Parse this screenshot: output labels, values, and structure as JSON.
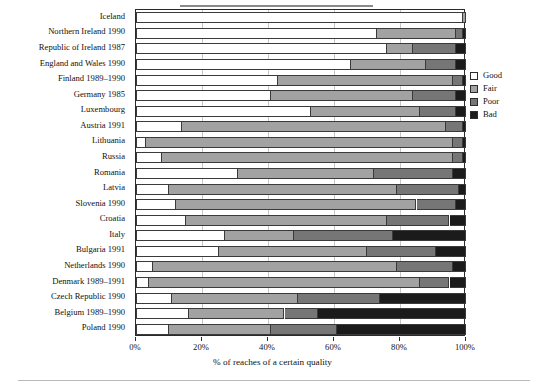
{
  "figure": {
    "axis_title": "% of reaches of a certain quality",
    "x_ticks": [
      "0%",
      "20%",
      "40%",
      "60%",
      "80%",
      "100%"
    ]
  },
  "legend": {
    "items": [
      {
        "label": "Good",
        "color": "#ffffff"
      },
      {
        "label": "Fair",
        "color": "#a2a2a2"
      },
      {
        "label": "Poor",
        "color": "#767676"
      },
      {
        "label": "Bad",
        "color": "#1b1b1b"
      }
    ]
  },
  "chart_data": {
    "type": "bar",
    "orientation": "horizontal",
    "stacked": true,
    "stack_mode": "percent",
    "title": "",
    "xlabel": "% of reaches of a certain quality",
    "ylabel": "",
    "xlim": [
      0,
      100
    ],
    "xticks": [
      0,
      20,
      40,
      60,
      80,
      100
    ],
    "grid": true,
    "legend_position": "right",
    "categories": [
      "Iceland",
      "Northern Ireland 1990",
      "Republic of Ireland 1987",
      "England and Wales 1990",
      "Finland 1989–1990",
      "Germany 1985",
      "Luxembourg",
      "Austria 1991",
      "Lithuania",
      "Russia",
      "Romania",
      "Latvia",
      "Slovenia 1990",
      "Croatia",
      "Italy",
      "Bulgaria 1991",
      "Netherlands 1990",
      "Denmark 1989–1991",
      "Czech Republic 1990",
      "Belgium 1989–1990",
      "Poland 1990"
    ],
    "series": [
      {
        "name": "Good",
        "color": "#ffffff",
        "values": [
          99,
          73,
          76,
          65,
          43,
          41,
          53,
          14,
          3,
          8,
          31,
          10,
          12,
          15,
          27,
          25,
          5,
          4,
          11,
          16,
          10
        ]
      },
      {
        "name": "Fair",
        "color": "#a2a2a2",
        "values": [
          1,
          24,
          8,
          23,
          53,
          43,
          33,
          80,
          93,
          88,
          41,
          69,
          73,
          61,
          21,
          45,
          74,
          82,
          38,
          29,
          31
        ]
      },
      {
        "name": "Poor",
        "color": "#767676",
        "values": [
          0,
          2,
          13,
          9,
          3,
          13,
          11,
          5,
          3,
          3,
          24,
          19,
          12,
          19,
          30,
          21,
          17,
          9,
          25,
          10,
          20
        ]
      },
      {
        "name": "Bad",
        "color": "#1b1b1b",
        "values": [
          0,
          1,
          3,
          3,
          1,
          3,
          3,
          1,
          1,
          1,
          4,
          2,
          3,
          5,
          22,
          9,
          4,
          5,
          26,
          45,
          39
        ]
      }
    ]
  }
}
